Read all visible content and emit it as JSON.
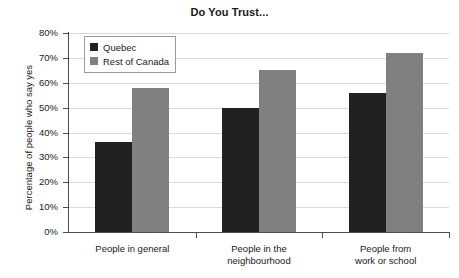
{
  "chart_data": {
    "type": "bar",
    "title": "Do You Trust...",
    "xlabel": "",
    "ylabel": "Percentage of people who say yes",
    "ylim": [
      0,
      80
    ],
    "ytick_labels": [
      "0%",
      "10%",
      "20%",
      "30%",
      "40%",
      "50%",
      "60%",
      "70%",
      "80%"
    ],
    "ytick_values": [
      0,
      10,
      20,
      30,
      40,
      50,
      60,
      70,
      80
    ],
    "grid": true,
    "legend_position": "upper-left-inside",
    "categories": [
      "People in general",
      "People in the neighbourhood",
      "People from work or school"
    ],
    "category_lines": [
      [
        "People in general"
      ],
      [
        "People in the",
        "neighbourhood"
      ],
      [
        "People from",
        "work or school"
      ]
    ],
    "series": [
      {
        "name": "Quebec",
        "color": "#212121",
        "values": [
          36,
          50,
          56
        ]
      },
      {
        "name": "Rest of Canada",
        "color": "#808080",
        "values": [
          58,
          65,
          72
        ]
      }
    ]
  },
  "colors": {
    "quebec": "#212121",
    "rest_of_canada": "#808080",
    "gridline": "#d9d9d9",
    "axis": "#4d4d4d",
    "background": "#ffffff",
    "text": "#1a1a1a"
  }
}
